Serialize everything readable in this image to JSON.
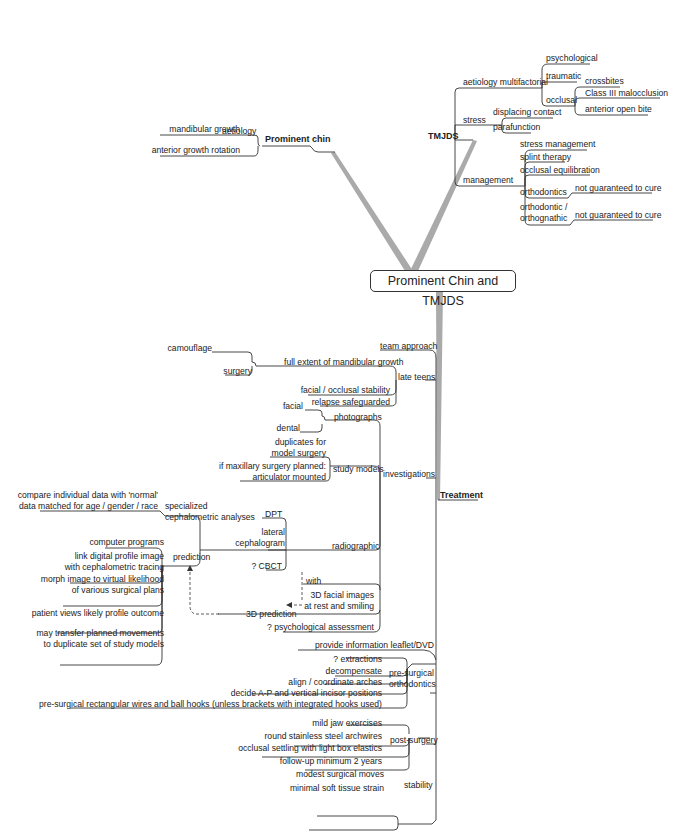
{
  "central": "Prominent Chin and TMJDS",
  "prominent_chin": {
    "label": "Prominent chin",
    "aetiology": "aetiology",
    "items": [
      "mandibular growth",
      "anterior growth rotation"
    ]
  },
  "tmjds": {
    "label": "TMJDS",
    "aetiology": {
      "label": "aetiology multifactorial",
      "psychological": "psychological",
      "traumatic": "traumatic",
      "occlusal": "occlusal",
      "occlusal_items": [
        "crossbites",
        "Class III malocclusion",
        "anterior open bite"
      ]
    },
    "stress": {
      "label": "stress",
      "items": [
        "displacing contact",
        "parafunction"
      ]
    },
    "management": {
      "label": "management",
      "stress_management": "stress management",
      "splint": "splint therapy",
      "equilibration": "occlusal equilibration",
      "orthodontics": "orthodontics",
      "orthodontics_note": "not guaranteed to cure",
      "ortho_orthognathic_1": "orthodontic /",
      "ortho_orthognathic_2": "orthognathic",
      "ortho_orthognathic_note": "not guaranteed to cure"
    }
  },
  "treatment": {
    "label": "Treatment",
    "team": "team approach",
    "late_teens": {
      "label": "late teens",
      "full_extent": "full extent of mandibular growth",
      "camouflage": "camouflage",
      "surgery": "surgery",
      "stability": "facial / occlusal stability",
      "relapse": "relapse safeguarded"
    },
    "investigations": {
      "label": "investigations",
      "photographs": "photographs",
      "facial": "facial",
      "dental": "dental",
      "study_models": "study models",
      "duplicates_1": "duplicates for",
      "duplicates_2": "model surgery",
      "maxillary_1": "if maxillary surgery planned:",
      "maxillary_2": "articulator mounted",
      "radiographic": "radiographic",
      "dpt": "DPT",
      "lateral_1": "lateral",
      "lateral_2": "cephalogram",
      "cbct": "? CBCT",
      "specialized_1": "specialized",
      "specialized_2": "cephalometric analyses",
      "compare_1": "compare individual data with 'normal'",
      "compare_2": "data matched for age / gender / race",
      "prediction": "prediction",
      "computer": "computer programs",
      "link_1": "link digital profile image",
      "link_2": "with cephalometric tracing",
      "morph_1": "morph image to virtual likelihood",
      "morph_2": "of various surgical plans",
      "patient_views": "patient views likely profile outcome",
      "transfer_1": "may transfer planned movements",
      "transfer_2": "to duplicate set of study models",
      "with": "with",
      "facial3d_1": "3D facial images",
      "facial3d_2": "at rest and smiling",
      "prediction3d": "3D prediction",
      "psych": "? psychological assessment"
    },
    "leaflet": "provide information leaflet/DVD",
    "presurgical": {
      "label_1": "pre-surgical",
      "label_2": "orthodontics",
      "extractions": "? extractions",
      "decompensate": "decompensate",
      "align": "align / coordinate arches",
      "decide": "decide A-P and vertical incisor positions",
      "wires": "pre-surgical rectangular wires and ball hooks (unless brackets with integrated hooks used)"
    },
    "postsurgery": {
      "label": "post-surgery",
      "items": [
        "mild jaw exercises",
        "round stainless steel archwires",
        "occlusal settling with light box elastics",
        "follow-up minimum 2 years"
      ]
    },
    "stability": {
      "label": "stability",
      "items": [
        "modest surgical moves",
        "minimal soft tissue strain"
      ]
    }
  }
}
